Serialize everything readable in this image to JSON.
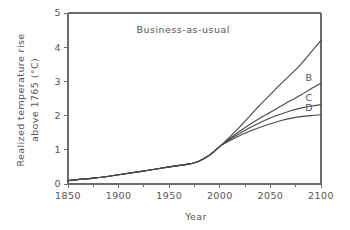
{
  "chart_data": {
    "type": "line",
    "title": "",
    "xlabel": "Year",
    "ylabel": "Realized temperature rise above 1765 (°C)",
    "ylabel_line1": "Realized temperature rise",
    "ylabel_line2": "above 1765 (°C)",
    "xlim": [
      1850,
      2100
    ],
    "ylim": [
      0,
      5
    ],
    "xticks": [
      1850,
      1900,
      1950,
      2000,
      2050,
      2100
    ],
    "xtick_labels": [
      "1850",
      "1900",
      "1950",
      "2000",
      "2050",
      "2100"
    ],
    "xminor_ticks": [
      1875,
      1925,
      1975,
      2025,
      2075
    ],
    "yticks": [
      0,
      1,
      2,
      3,
      4,
      5
    ],
    "ytick_labels": [
      "0",
      "1",
      "2",
      "3",
      "4",
      "5"
    ],
    "grid": false,
    "legend_position": "inline-annotations",
    "line_color": "#4a4a4a",
    "axis_color": "#6b6b6b",
    "annotations": [
      {
        "name": "business-as-usual",
        "text": "Business-as-usual",
        "x": 2010,
        "y": 4.42
      }
    ],
    "curve_end_labels": [
      {
        "name": "B",
        "text": "B",
        "x": 2088,
        "y": 3.02
      },
      {
        "name": "C",
        "text": "C",
        "x": 2088,
        "y": 2.42
      },
      {
        "name": "D",
        "text": "D",
        "x": 2088,
        "y": 2.12
      }
    ],
    "x": [
      1850,
      1875,
      1900,
      1925,
      1950,
      1975,
      1990,
      2000,
      2010,
      2020,
      2030,
      2040,
      2050,
      2060,
      2070,
      2080,
      2090,
      2100
    ],
    "series": [
      {
        "name": "Business-as-usual",
        "label": "Business-as-usual",
        "values": [
          0.1,
          0.17,
          0.27,
          0.38,
          0.5,
          0.62,
          0.85,
          1.1,
          1.38,
          1.68,
          2.0,
          2.32,
          2.62,
          2.92,
          3.2,
          3.5,
          3.85,
          4.2
        ]
      },
      {
        "name": "Scenario B",
        "label": "B",
        "values": [
          0.1,
          0.17,
          0.27,
          0.38,
          0.5,
          0.62,
          0.85,
          1.1,
          1.33,
          1.55,
          1.75,
          1.93,
          2.1,
          2.27,
          2.44,
          2.6,
          2.78,
          2.95
        ]
      },
      {
        "name": "Scenario C",
        "label": "C",
        "values": [
          0.1,
          0.17,
          0.27,
          0.38,
          0.5,
          0.62,
          0.85,
          1.1,
          1.3,
          1.48,
          1.65,
          1.8,
          1.93,
          2.04,
          2.14,
          2.22,
          2.28,
          2.32
        ]
      },
      {
        "name": "Scenario D",
        "label": "D",
        "values": [
          0.1,
          0.17,
          0.27,
          0.38,
          0.5,
          0.62,
          0.85,
          1.1,
          1.27,
          1.42,
          1.55,
          1.66,
          1.76,
          1.85,
          1.92,
          1.97,
          2.0,
          2.02
        ]
      }
    ]
  }
}
